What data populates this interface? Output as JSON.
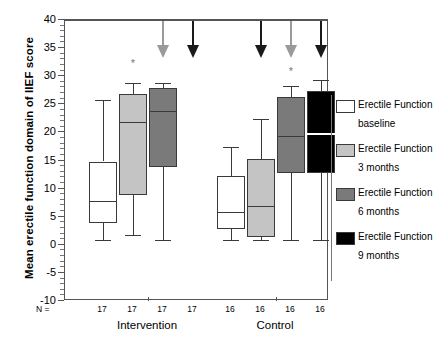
{
  "chart_data": {
    "type": "box",
    "title": "",
    "xlabel": "",
    "ylabel": "Mean erectile function domain of IIEF score",
    "ylim": [
      -10,
      40
    ],
    "ytick_step": 5,
    "ytick_labels": [
      "40",
      "35",
      "30",
      "25",
      "20",
      "15",
      "10",
      "5",
      "0",
      "-5",
      "-10"
    ],
    "ytick_values": [
      40,
      35,
      30,
      25,
      20,
      15,
      10,
      5,
      0,
      -5,
      -10
    ],
    "grid": false,
    "legend_position": "right",
    "n_prefix": "N =",
    "groups": [
      {
        "name": "Intervention",
        "boxes": [
          {
            "series": "Erectile Function baseline",
            "n": "17",
            "min": 1,
            "q1": 4,
            "median": 8,
            "q3": 15,
            "max": 26,
            "fill": "#ffffff",
            "present": true
          },
          {
            "series": "Erectile Function 3 months",
            "n": "17",
            "min": 2,
            "q1": 9,
            "median": 22,
            "q3": 27,
            "max": 29,
            "fill": "#c4c4c4",
            "present": true
          },
          {
            "series": "Erectile Function 6 months",
            "n": "17",
            "min": 1,
            "q1": 14,
            "median": 24,
            "q3": 28,
            "max": 29,
            "fill": "#7a7a7a",
            "present": true
          },
          {
            "series": "Erectile Function 9 months",
            "n": "17",
            "min": null,
            "q1": null,
            "median": null,
            "q3": null,
            "max": null,
            "fill": "#000000",
            "present": false
          }
        ],
        "arrows": [
          {
            "color": "#9a9a9a",
            "at_box": 2
          },
          {
            "color": "#1a1a1a",
            "at_box": 3
          }
        ],
        "asterisk": {
          "label": "*",
          "y": 33.5
        }
      },
      {
        "name": "Control",
        "boxes": [
          {
            "series": "Erectile Function baseline",
            "n": "16",
            "min": 1,
            "q1": 3,
            "median": 6,
            "q3": 12.5,
            "max": 17.5,
            "fill": "#ffffff",
            "present": true
          },
          {
            "series": "Erectile Function 3 months",
            "n": "16",
            "min": 1,
            "q1": 1.5,
            "median": 7,
            "q3": 15.5,
            "max": 22.5,
            "fill": "#c4c4c4",
            "present": true
          },
          {
            "series": "Erectile Function 6 months",
            "n": "16",
            "min": 1,
            "q1": 13,
            "median": 19.5,
            "q3": 26.5,
            "max": 28.5,
            "fill": "#7a7a7a",
            "present": true
          },
          {
            "series": "Erectile Function 9 months",
            "n": "16",
            "min": 1,
            "q1": 13,
            "median": 20,
            "q3": 27.5,
            "max": 29.5,
            "fill": "#000000",
            "present": true
          }
        ],
        "arrows": [
          {
            "color": "#1a1a1a",
            "at_box": 1
          },
          {
            "color": "#9a9a9a",
            "at_box": 2
          },
          {
            "color": "#1a1a1a",
            "at_box": 3
          }
        ],
        "asterisk": {
          "label": "*",
          "y": 32
        }
      }
    ],
    "legend": [
      {
        "line1": "Erectile Function",
        "line2": "baseline",
        "color": "#ffffff"
      },
      {
        "line1": "Erectile Function",
        "line2": "3 months",
        "color": "#c4c4c4"
      },
      {
        "line1": "Erectile Function",
        "line2": "6 months",
        "color": "#7a7a7a"
      },
      {
        "line1": "Erectile Function",
        "line2": "9 months",
        "color": "#000000"
      }
    ]
  }
}
